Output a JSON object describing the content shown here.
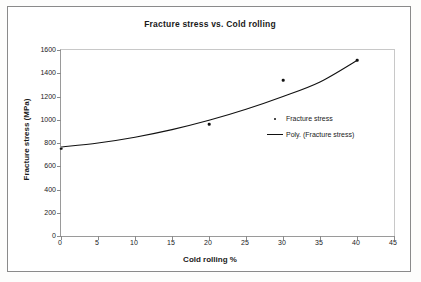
{
  "chart_data": {
    "type": "scatter",
    "title": "Fracture stress vs. Cold rolling",
    "xlabel": "Cold rolling %",
    "ylabel": "Fracture stress (MPa)",
    "xlim": [
      0,
      45
    ],
    "ylim": [
      0,
      1600
    ],
    "xticks": [
      0,
      5,
      10,
      15,
      20,
      25,
      30,
      35,
      40,
      45
    ],
    "yticks": [
      0,
      200,
      400,
      600,
      800,
      1000,
      1200,
      1400,
      1600
    ],
    "grid": false,
    "legend_position": "inside-right",
    "series": [
      {
        "name": "Fracture stress",
        "marker": "dot",
        "color": "#111111",
        "x": [
          0,
          20,
          30,
          40
        ],
        "values": [
          750,
          960,
          1340,
          1510
        ]
      },
      {
        "name": "Poly. (Fracture stress)",
        "marker": "line",
        "color": "#111111",
        "x": [
          0,
          5,
          10,
          15,
          20,
          25,
          30,
          35,
          40
        ],
        "values": [
          765,
          800,
          850,
          915,
          995,
          1090,
          1200,
          1325,
          1510
        ]
      }
    ],
    "legend": [
      {
        "label": "Fracture stress",
        "key": "dot"
      },
      {
        "label": "Poly. (Fracture stress)",
        "key": "line"
      }
    ]
  },
  "axis": {
    "y_tick_labels": [
      "1600",
      "1400",
      "1200",
      "1000",
      "800",
      "600",
      "400",
      "200",
      "0"
    ],
    "x_tick_labels": [
      "0",
      "5",
      "10",
      "15",
      "20",
      "25",
      "30",
      "35",
      "40",
      "45"
    ]
  }
}
